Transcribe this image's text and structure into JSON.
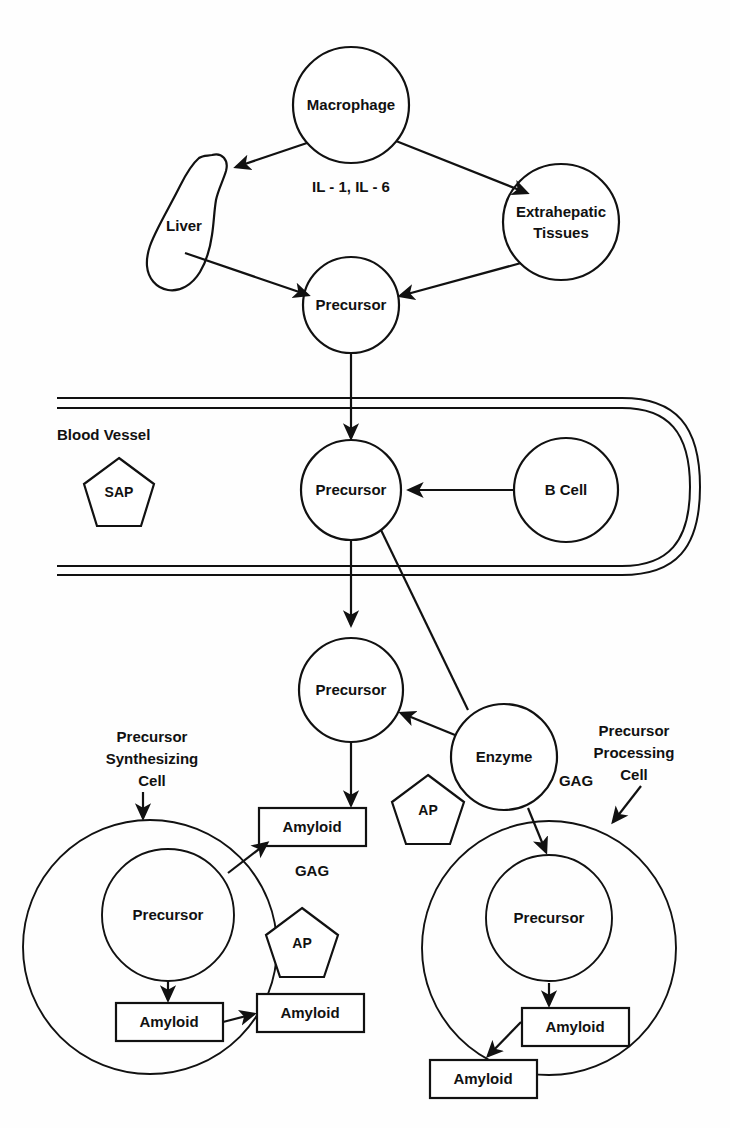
{
  "diagram": {
    "nodes": {
      "macrophage": "Macrophage",
      "cytokines": "IL - 1, IL - 6",
      "liver": "Liver",
      "extrahepatic": "Extrahepatic",
      "extrahepatic2": "Tissues",
      "precursor_top": "Precursor",
      "precursor_vessel": "Precursor",
      "precursor_mid": "Precursor",
      "precursor_left_cell": "Precursor",
      "precursor_right_cell": "Precursor",
      "b_cell": "B Cell",
      "enzyme": "Enzyme",
      "blood_vessel": "Blood Vessel",
      "sap": "SAP",
      "ap_mid": "AP",
      "ap_left": "AP",
      "gag_left": "GAG",
      "gag_right": "GAG",
      "amyloid_mid": "Amyloid",
      "amyloid_left_inner": "Amyloid",
      "amyloid_left_outer": "Amyloid",
      "amyloid_right_inner": "Amyloid",
      "amyloid_right_outer": "Amyloid"
    },
    "annotations": {
      "precursor_synthesizing_cell": [
        "Precursor",
        "Synthesizing",
        "Cell"
      ],
      "precursor_processing_cell": [
        "Precursor",
        "Processing",
        "Cell"
      ]
    },
    "colors": {
      "stroke": "#111111",
      "fill": "#ffffff",
      "background": "#fefefe"
    }
  }
}
